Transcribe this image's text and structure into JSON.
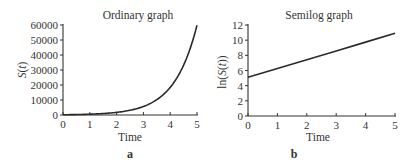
{
  "chart_data": [
    {
      "type": "line",
      "panel_label": "a",
      "title": "Ordinary graph",
      "xlabel": "Time",
      "ylabel": "S(t)",
      "xlim": [
        0,
        5
      ],
      "ylim": [
        0,
        60000
      ],
      "xticks": [
        "0",
        "1",
        "2",
        "3",
        "4",
        "5"
      ],
      "yticks": [
        "0",
        "10000",
        "20000",
        "30000",
        "40000",
        "50000",
        "60000"
      ],
      "grid": false,
      "legend": null,
      "series": [
        {
          "name": "S(t)",
          "x": [
            0,
            0.5,
            1,
            1.5,
            2,
            2.5,
            3,
            3.5,
            4,
            4.5,
            5
          ],
          "values": [
            165,
            295,
            527,
            940,
            1680,
            3000,
            5350,
            9560,
            17070,
            30480,
            59870
          ]
        }
      ]
    },
    {
      "type": "line",
      "panel_label": "b",
      "title": "Semilog graph",
      "xlabel": "Time",
      "ylabel": "ln(S(t))",
      "xlim": [
        0,
        5
      ],
      "ylim": [
        0,
        12
      ],
      "xticks": [
        "0",
        "1",
        "2",
        "3",
        "4",
        "5"
      ],
      "yticks": [
        "0",
        "2",
        "4",
        "6",
        "8",
        "10",
        "12"
      ],
      "grid": false,
      "legend": null,
      "series": [
        {
          "name": "ln(S(t))",
          "x": [
            0,
            1,
            2,
            3,
            4,
            5
          ],
          "values": [
            5.1,
            6.26,
            7.42,
            8.58,
            9.74,
            10.9
          ]
        }
      ]
    }
  ]
}
